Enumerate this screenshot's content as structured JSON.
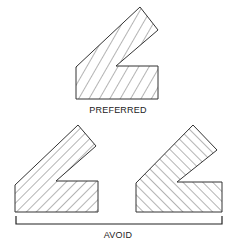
{
  "diagram": {
    "type": "weld-joint-hatching-comparison",
    "colors": {
      "stroke": "#333333",
      "hatch": "#444444",
      "background": "#ffffff"
    },
    "preferred": {
      "label": "PREFERRED",
      "hatch_direction": "uniform diagonal (/) across whole section"
    },
    "avoid": {
      "label": "AVOID",
      "examples": [
        {
          "hatch_direction": "diagonal (/) hatching"
        },
        {
          "hatch_direction": "diagonal (\\) hatching"
        }
      ]
    }
  }
}
